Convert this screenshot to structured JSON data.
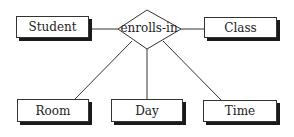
{
  "diagram": {
    "type": "entity-relationship",
    "relationship": {
      "label": "enrolls-in"
    },
    "entities": [
      {
        "id": "student",
        "label": "Student"
      },
      {
        "id": "class",
        "label": "Class"
      },
      {
        "id": "room",
        "label": "Room"
      },
      {
        "id": "day",
        "label": "Day"
      },
      {
        "id": "time",
        "label": "Time"
      }
    ],
    "connections": [
      {
        "from": "enrolls-in",
        "to": "Student"
      },
      {
        "from": "enrolls-in",
        "to": "Class"
      },
      {
        "from": "enrolls-in",
        "to": "Room"
      },
      {
        "from": "enrolls-in",
        "to": "Day"
      },
      {
        "from": "enrolls-in",
        "to": "Time"
      }
    ],
    "colors": {
      "stroke": "#333333",
      "shadow": "#1a1a1a",
      "fill": "#ffffff"
    }
  }
}
